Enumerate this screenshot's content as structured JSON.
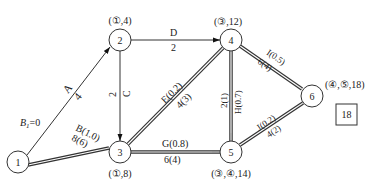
{
  "diagram": {
    "type": "network-critical-path",
    "nodes": [
      {
        "id": "1",
        "label": "1",
        "cx": 18,
        "cy": 162,
        "annotation": "B₁=0"
      },
      {
        "id": "2",
        "label": "2",
        "cx": 120,
        "cy": 40,
        "annotation": "(①,4)"
      },
      {
        "id": "3",
        "label": "3",
        "cx": 120,
        "cy": 152,
        "annotation": "(①,8)"
      },
      {
        "id": "4",
        "label": "4",
        "cx": 231,
        "cy": 40,
        "annotation": "(③,12)"
      },
      {
        "id": "5",
        "label": "5",
        "cx": 231,
        "cy": 152,
        "annotation": "(③,④,14)"
      },
      {
        "id": "6",
        "label": "6",
        "cx": 312,
        "cy": 96,
        "annotation": "(④,⑤,18)"
      }
    ],
    "edges": [
      {
        "from": "1",
        "to": "2",
        "name": "A",
        "duration": "4",
        "critical": false
      },
      {
        "from": "1",
        "to": "3",
        "name": "B(1.0)",
        "duration": "8(6)",
        "critical": true
      },
      {
        "from": "2",
        "to": "3",
        "name": "C",
        "duration": "2",
        "critical": false
      },
      {
        "from": "2",
        "to": "4",
        "name": "D",
        "duration": "2",
        "critical": false
      },
      {
        "from": "3",
        "to": "4",
        "name": "E(0.2)",
        "duration": "4(3)",
        "critical": true
      },
      {
        "from": "3",
        "to": "5",
        "name": "G(0.8)",
        "duration": "6(4)",
        "critical": true
      },
      {
        "from": "4",
        "to": "5",
        "name": "H(0.7)",
        "duration": "2(1)",
        "critical": true
      },
      {
        "from": "4",
        "to": "6",
        "name": "I(0.5)",
        "duration": "6(4)",
        "critical": true
      },
      {
        "from": "5",
        "to": "6",
        "name": "J(0.2)",
        "duration": "4(2)",
        "critical": true
      }
    ],
    "total_box": "18"
  },
  "labels": {
    "n1": "1",
    "n2": "2",
    "n3": "3",
    "n4": "4",
    "n5": "5",
    "n6": "6",
    "ann_b1_main": "B",
    "ann_b1_sub": "1",
    "ann_b1_rest": "=0",
    "ann2": "(①,4)",
    "ann3": "(①,8)",
    "ann4": "(③,12)",
    "ann5": "(③,④,14)",
    "ann6": "(④,⑤,18)",
    "eA_name": "A",
    "eA_dur": "4",
    "eB_name": "B(1.0)",
    "eB_dur": "8(6)",
    "eC_name": "C",
    "eC_dur": "2",
    "eD_name": "D",
    "eD_dur": "2",
    "eE_name": "E(0.2)",
    "eE_dur": "4(3)",
    "eG_name": "G(0.8)",
    "eG_dur": "6(4)",
    "eH_name": "H(0.7)",
    "eH_dur": "2(1)",
    "eI_name": "I(0.5)",
    "eI_dur": "6(4)",
    "eJ_name": "J(0.2)",
    "eJ_dur": "4(2)",
    "total": "18"
  }
}
